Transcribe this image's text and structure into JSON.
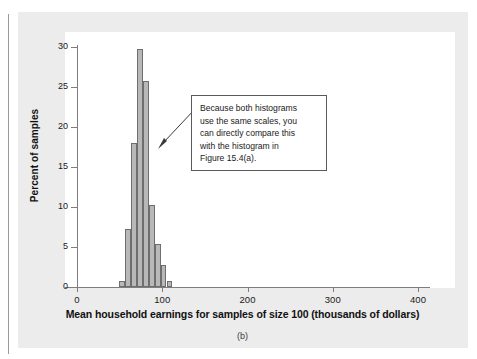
{
  "figure": {
    "caption": "(b)",
    "background_color": "#ececec",
    "plot_background_color": "#ffffff"
  },
  "annotation": {
    "text": "Because both histograms\nuse the same scales, you\ncan directly compare this\nwith the histogram in\nFigure 15.4(a).",
    "border_color": "#5a5a5a",
    "arrow_target": "histogram peak"
  },
  "chart_data": {
    "type": "bar",
    "title": "",
    "subtitle": "",
    "xlabel": "Mean household earnings for samples of size 100 (thousands of dollars)",
    "ylabel": "Percent of samples",
    "xlim": [
      0,
      420
    ],
    "ylim": [
      0,
      31
    ],
    "xticks": [
      0,
      100,
      200,
      300,
      400
    ],
    "xtick_labels": [
      "0",
      "100",
      "200",
      "300",
      "400"
    ],
    "yticks": [
      0,
      5,
      10,
      15,
      20,
      25,
      30
    ],
    "ytick_labels": [
      "0",
      "5",
      "10",
      "15",
      "20",
      "25",
      "30"
    ],
    "grid": false,
    "legend": null,
    "bar_fill_color": "#b8b8b8",
    "bar_edge_color": "#6e6e6e",
    "bin_width": 7,
    "bins": [
      {
        "x0": 49,
        "x1": 56,
        "value": 0.8
      },
      {
        "x0": 56,
        "x1": 63,
        "value": 7.3
      },
      {
        "x0": 63,
        "x1": 70,
        "value": 18.0
      },
      {
        "x0": 70,
        "x1": 77,
        "value": 29.7
      },
      {
        "x0": 77,
        "x1": 84,
        "value": 25.7
      },
      {
        "x0": 84,
        "x1": 91,
        "value": 10.3
      },
      {
        "x0": 91,
        "x1": 98,
        "value": 5.4
      },
      {
        "x0": 98,
        "x1": 105,
        "value": 2.7
      },
      {
        "x0": 105,
        "x1": 112,
        "value": 0.7
      }
    ],
    "categories": [
      "49-56",
      "56-63",
      "63-70",
      "70-77",
      "77-84",
      "84-91",
      "91-98",
      "98-105",
      "105-112"
    ],
    "values": [
      0.8,
      7.3,
      18.0,
      29.7,
      25.7,
      10.3,
      5.4,
      2.7,
      0.7
    ]
  }
}
